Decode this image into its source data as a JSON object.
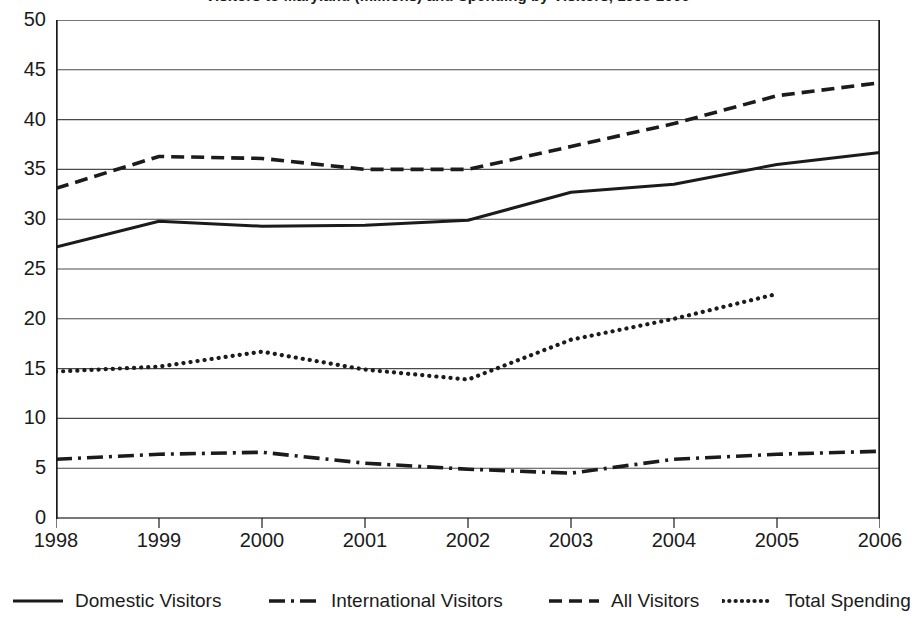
{
  "chart_data": {
    "type": "line",
    "title": "Visitors to Maryland (millions) and Spending by Visitors, 1998-2006",
    "xlabel": "",
    "ylabel": "",
    "categories": [
      "1998",
      "1999",
      "2000",
      "2001",
      "2002",
      "2003",
      "2004",
      "2005",
      "2006"
    ],
    "x": [
      1998,
      1999,
      2000,
      2001,
      2002,
      2003,
      2004,
      2005,
      2006
    ],
    "ylim": [
      0,
      50
    ],
    "yticks": [
      0,
      5,
      10,
      15,
      20,
      25,
      30,
      35,
      40,
      45,
      50
    ],
    "grid": true,
    "legend_position": "bottom",
    "series": [
      {
        "name": "Domestic Visitors",
        "style": "solid",
        "color": "#1b1b1b",
        "values": [
          27.2,
          29.8,
          29.3,
          29.4,
          29.9,
          32.7,
          33.5,
          35.5,
          36.7
        ]
      },
      {
        "name": "International Visitors",
        "style": "dash-dot",
        "color": "#1b1b1b",
        "values": [
          5.9,
          6.4,
          6.6,
          5.5,
          4.9,
          4.5,
          5.9,
          6.4,
          6.7
        ]
      },
      {
        "name": "All Visitors",
        "style": "dashed",
        "color": "#1b1b1b",
        "values": [
          33.1,
          36.3,
          36.1,
          35.0,
          35.0,
          37.3,
          39.6,
          42.4,
          43.7
        ]
      },
      {
        "name": "Total Spending",
        "style": "dotted",
        "color": "#1b1b1b",
        "values": [
          14.7,
          15.2,
          16.7,
          14.9,
          13.9,
          17.9,
          20.0,
          22.5,
          null
        ]
      }
    ]
  },
  "axes": {
    "y_labels": [
      "50",
      "45",
      "40",
      "35",
      "30",
      "25",
      "20",
      "15",
      "10",
      "5",
      "0"
    ],
    "x_labels": [
      "1998",
      "1999",
      "2000",
      "2001",
      "2002",
      "2003",
      "2004",
      "2005",
      "2006"
    ]
  },
  "legend": {
    "items": [
      {
        "label": "Domestic Visitors",
        "style": "solid"
      },
      {
        "label": "International Visitors",
        "style": "dash-dot"
      },
      {
        "label": "All Visitors",
        "style": "dashed"
      },
      {
        "label": "Total Spending",
        "style": "dotted"
      }
    ]
  },
  "colors": {
    "ink": "#1b1b1b",
    "grid": "#4a4a4a",
    "background": "#ffffff"
  }
}
